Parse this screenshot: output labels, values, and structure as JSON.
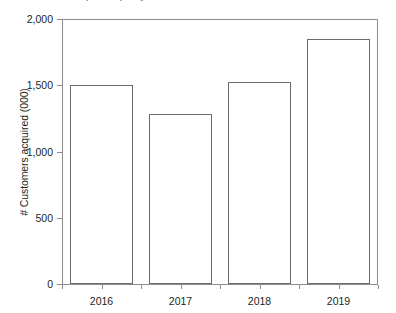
{
  "figure": {
    "title_fragment": "Customers acquired per year",
    "y_axis_title": "# Customers acquired (000)"
  },
  "chart_data": {
    "type": "bar",
    "title": "",
    "xlabel": "",
    "ylabel": "# Customers acquired (000)",
    "categories": [
      "2016",
      "2017",
      "2018",
      "2019"
    ],
    "values": [
      1500,
      1280,
      1525,
      1850
    ],
    "ylim": [
      0,
      2000
    ],
    "ytick_values": [
      0,
      500,
      1000,
      1500,
      2000
    ],
    "ytick_labels": [
      "0",
      "500",
      "1,000",
      "1,500",
      "2,000"
    ],
    "grid": false,
    "legend": null,
    "series": [
      {
        "name": "# Customers acquired (000)",
        "values": [
          1500,
          1280,
          1525,
          1850
        ]
      }
    ],
    "style": {
      "bar_fill": "#ffffff",
      "bar_stroke": "#6e6b6c",
      "axis_color": "#8e8b8c",
      "text_color": "#231f20"
    }
  }
}
